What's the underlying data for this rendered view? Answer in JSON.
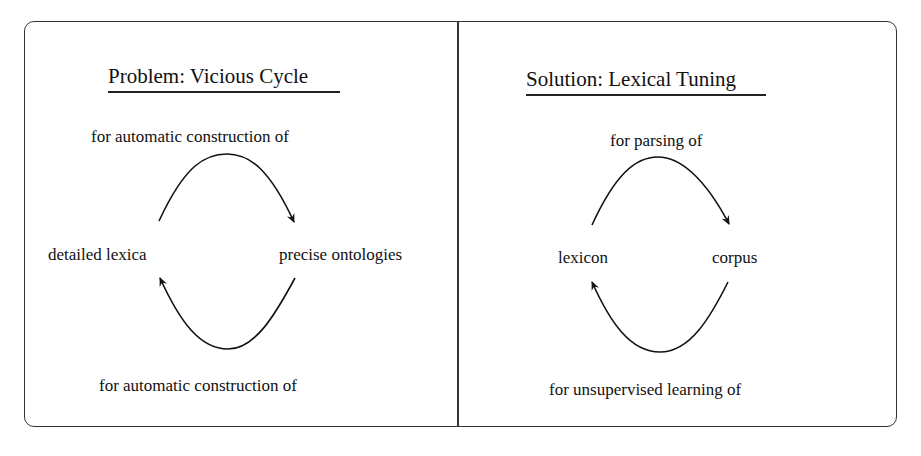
{
  "left_panel": {
    "title": "Problem: Vicious Cycle",
    "top_label": "for automatic construction of",
    "left_node": "detailed lexica",
    "right_node": "precise ontologies",
    "bottom_label": "for automatic construction of"
  },
  "right_panel": {
    "title": "Solution: Lexical Tuning",
    "top_label": "for parsing of",
    "left_node": "lexicon",
    "right_node": "corpus",
    "bottom_label": "for unsupervised learning of"
  }
}
